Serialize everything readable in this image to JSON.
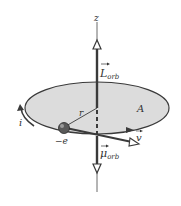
{
  "diagram": {
    "labels": {
      "z_axis": "z",
      "angular_momentum": "L",
      "angular_momentum_sub": "orb",
      "area": "A",
      "radius": "r",
      "current": "i",
      "charge": "−e",
      "velocity": "v",
      "magnetic_moment": "μ",
      "magnetic_moment_sub": "orb"
    },
    "colors": {
      "orbit_fill": "#dcdcdc",
      "orbit_stroke": "#3a3a3a",
      "vector": "#3a3a3a",
      "axis": "#6a6a6a",
      "electron": "#555555"
    }
  }
}
